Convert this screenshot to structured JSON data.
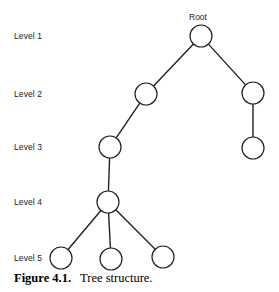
{
  "figure": {
    "number_label": "Figure 4.1.",
    "caption_text": "Tree structure.",
    "root_label": "Root"
  },
  "levels": [
    {
      "label": "Level 1",
      "x": 14,
      "y": 32
    },
    {
      "label": "Level 2",
      "x": 14,
      "y": 90
    },
    {
      "label": "Level 3",
      "x": 14,
      "y": 143
    },
    {
      "label": "Level 4",
      "x": 14,
      "y": 198
    },
    {
      "label": "Level 5",
      "x": 14,
      "y": 254
    }
  ],
  "chart_data": {
    "type": "diagram",
    "title": "Tree structure",
    "nodes": [
      {
        "id": "root",
        "level": 1,
        "cx": 201,
        "cy": 36,
        "r": 11,
        "label": "Root"
      },
      {
        "id": "n2a",
        "level": 2,
        "cx": 146,
        "cy": 94,
        "r": 11,
        "label": ""
      },
      {
        "id": "n2b",
        "level": 2,
        "cx": 253,
        "cy": 93,
        "r": 11,
        "label": ""
      },
      {
        "id": "n3a",
        "level": 3,
        "cx": 110,
        "cy": 147,
        "r": 11,
        "label": ""
      },
      {
        "id": "n3b",
        "level": 3,
        "cx": 253,
        "cy": 148,
        "r": 11,
        "label": ""
      },
      {
        "id": "n4a",
        "level": 4,
        "cx": 108,
        "cy": 202,
        "r": 11,
        "label": ""
      },
      {
        "id": "n5a",
        "level": 5,
        "cx": 61,
        "cy": 258,
        "r": 11,
        "label": ""
      },
      {
        "id": "n5b",
        "level": 5,
        "cx": 111,
        "cy": 259,
        "r": 11,
        "label": ""
      },
      {
        "id": "n5c",
        "level": 5,
        "cx": 163,
        "cy": 257,
        "r": 11,
        "label": ""
      }
    ],
    "edges": [
      {
        "from": "root",
        "to": "n2a"
      },
      {
        "from": "root",
        "to": "n2b"
      },
      {
        "from": "n2a",
        "to": "n3a"
      },
      {
        "from": "n2b",
        "to": "n3b"
      },
      {
        "from": "n3a",
        "to": "n4a"
      },
      {
        "from": "n4a",
        "to": "n5a"
      },
      {
        "from": "n4a",
        "to": "n5b"
      },
      {
        "from": "n4a",
        "to": "n5c"
      }
    ],
    "style": {
      "node_fill": "#ffffff",
      "node_stroke": "#222222",
      "node_stroke_width": 1.2,
      "edge_stroke": "#222222",
      "edge_stroke_width": 1.4,
      "background": "#ffffff"
    }
  }
}
